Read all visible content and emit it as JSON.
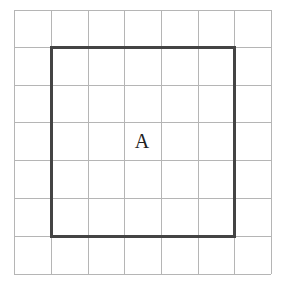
{
  "diagram": {
    "type": "grid-with-square",
    "grid": {
      "cols": 7,
      "rows": 7,
      "x_lines": [
        14,
        51,
        88,
        124,
        161,
        198,
        234,
        271
      ],
      "y_lines": [
        10,
        47,
        85,
        122,
        160,
        198,
        236,
        274
      ],
      "line_color": "#b5b5b5"
    },
    "shape": {
      "name": "A",
      "from_col": 1,
      "to_col": 6,
      "from_row": 1,
      "to_row": 6,
      "stroke_color": "#444444",
      "stroke_width": 3
    },
    "label": {
      "text": "A",
      "x": 142,
      "y": 141
    }
  }
}
